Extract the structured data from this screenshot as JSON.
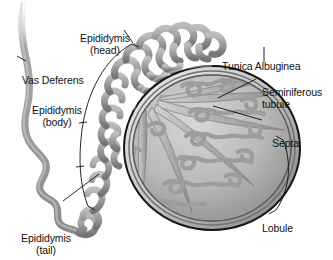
{
  "figure": {
    "background_color": "#ffffff",
    "text_color": "#101010",
    "tissue_color": "#9a9a9a",
    "tissue_dark": "#6e6e6e",
    "tissue_light": "#c9c9c9",
    "outline_color": "#1a1a1a"
  },
  "labels": {
    "epididymis_head": "Epididymis\n(head)",
    "vas_deferens": "Vas Deferens",
    "epididymis_body": "Epididymis\n(body)",
    "epididymis_tail": "Epididymis\n(tail)",
    "tunica_albuginea": "Tunica Albuginea",
    "seminiferous_tubule": "Seminiferous\ntubule",
    "septa": "Septa",
    "lobule": "Lobule"
  },
  "structures": [
    {
      "name": "vas-deferens",
      "description": "long wavy duct leaving upper left, coiling at lower left"
    },
    {
      "name": "epididymis-head",
      "description": "densely coiled tube over superior pole of testis"
    },
    {
      "name": "epididymis-body",
      "description": "coiled tube along posterior-left border of testis"
    },
    {
      "name": "epididymis-tail",
      "description": "coiled tube at inferior-left, continuous with vas deferens"
    },
    {
      "name": "tunica-albuginea",
      "description": "dense outer capsule of the testis"
    },
    {
      "name": "seminiferous-tubules",
      "description": "convoluted tubules filling each lobule"
    },
    {
      "name": "septa",
      "description": "fibrous partitions radiating from mediastinum"
    },
    {
      "name": "lobule",
      "description": "wedge-shaped compartment bounded by septa"
    }
  ],
  "annotations": {
    "bracket_epididymis": "curved bracket spanning head, body and tail regions",
    "bracket_lobule": "arc bracket along right border of testis",
    "leader_lines": 5
  }
}
